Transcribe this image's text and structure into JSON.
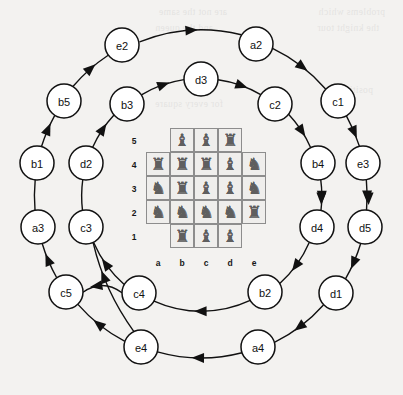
{
  "figure": {
    "type": "state-transition-diagram-with-chessboard"
  },
  "background_bleed_text": [
    "problems which",
    "are not the same",
    "the knight tour",
    "and the queen",
    "positions",
    "for every square"
  ],
  "board": {
    "files": [
      "a",
      "b",
      "c",
      "d",
      "e"
    ],
    "ranks": [
      "5",
      "4",
      "3",
      "2",
      "1"
    ],
    "rank_labels": [
      "5",
      "4",
      "3",
      "2",
      "1"
    ],
    "file_labels": [
      "a",
      "b",
      "c",
      "d",
      "e"
    ],
    "piece_glyphs": {
      "rook": "♜",
      "bishop": "♝",
      "knight": "♞",
      "empty": ""
    },
    "cells": [
      {
        "file": "b",
        "rank": "5",
        "piece": "bishop"
      },
      {
        "file": "c",
        "rank": "5",
        "piece": "bishop"
      },
      {
        "file": "d",
        "rank": "5",
        "piece": "rook"
      },
      {
        "file": "a",
        "rank": "4",
        "piece": "rook"
      },
      {
        "file": "b",
        "rank": "4",
        "piece": "rook"
      },
      {
        "file": "c",
        "rank": "4",
        "piece": "rook"
      },
      {
        "file": "d",
        "rank": "4",
        "piece": "bishop"
      },
      {
        "file": "e",
        "rank": "4",
        "piece": "knight"
      },
      {
        "file": "a",
        "rank": "3",
        "piece": "knight"
      },
      {
        "file": "b",
        "rank": "3",
        "piece": "rook"
      },
      {
        "file": "c",
        "rank": "3",
        "piece": "bishop"
      },
      {
        "file": "d",
        "rank": "3",
        "piece": "bishop"
      },
      {
        "file": "e",
        "rank": "3",
        "piece": "knight"
      },
      {
        "file": "a",
        "rank": "2",
        "piece": "knight"
      },
      {
        "file": "b",
        "rank": "2",
        "piece": "knight"
      },
      {
        "file": "c",
        "rank": "2",
        "piece": "knight"
      },
      {
        "file": "d",
        "rank": "2",
        "piece": "knight"
      },
      {
        "file": "e",
        "rank": "2",
        "piece": "rook"
      },
      {
        "file": "b",
        "rank": "1",
        "piece": "rook"
      },
      {
        "file": "c",
        "rank": "1",
        "piece": "bishop"
      },
      {
        "file": "d",
        "rank": "1",
        "piece": "bishop"
      }
    ]
  },
  "graph": {
    "outer_cycle": {
      "name": "outer-cycle",
      "nodes": [
        "e2",
        "a2",
        "c1",
        "e3",
        "d5",
        "d1",
        "a4",
        "e4",
        "c5",
        "a3",
        "b1",
        "b5"
      ],
      "direction": "clockwise"
    },
    "inner_cycle": {
      "name": "inner-cycle",
      "nodes": [
        "d3",
        "c2",
        "b4",
        "d4",
        "b2",
        "c4",
        "c3",
        "d2",
        "b3"
      ],
      "direction": "clockwise"
    },
    "nodes": [
      {
        "id": "e2",
        "label": "e2",
        "cx": 122,
        "cy": 45,
        "ring": "outer"
      },
      {
        "id": "a2",
        "label": "a2",
        "cx": 256,
        "cy": 44,
        "ring": "outer"
      },
      {
        "id": "c1",
        "label": "c1",
        "cx": 338,
        "cy": 101,
        "ring": "outer"
      },
      {
        "id": "e3",
        "label": "e3",
        "cx": 363,
        "cy": 163,
        "ring": "outer"
      },
      {
        "id": "d5",
        "label": "d5",
        "cx": 365,
        "cy": 227,
        "ring": "outer"
      },
      {
        "id": "d1",
        "label": "d1",
        "cx": 336,
        "cy": 293,
        "ring": "outer"
      },
      {
        "id": "a4",
        "label": "a4",
        "cx": 258,
        "cy": 347,
        "ring": "outer"
      },
      {
        "id": "e4",
        "label": "e4",
        "cx": 141,
        "cy": 347,
        "ring": "outer"
      },
      {
        "id": "c5",
        "label": "c5",
        "cx": 66,
        "cy": 292,
        "ring": "outer"
      },
      {
        "id": "a3",
        "label": "a3",
        "cx": 38,
        "cy": 227,
        "ring": "outer"
      },
      {
        "id": "b1",
        "label": "b1",
        "cx": 37,
        "cy": 163,
        "ring": "outer"
      },
      {
        "id": "b5",
        "label": "b5",
        "cx": 64,
        "cy": 101,
        "ring": "outer"
      },
      {
        "id": "d3",
        "label": "d3",
        "cx": 201,
        "cy": 79,
        "ring": "inner"
      },
      {
        "id": "c2",
        "label": "c2",
        "cx": 275,
        "cy": 104,
        "ring": "inner"
      },
      {
        "id": "b4",
        "label": "b4",
        "cx": 318,
        "cy": 163,
        "ring": "inner"
      },
      {
        "id": "d4",
        "label": "d4",
        "cx": 317,
        "cy": 227,
        "ring": "inner"
      },
      {
        "id": "b2",
        "label": "b2",
        "cx": 265,
        "cy": 292,
        "ring": "inner"
      },
      {
        "id": "c4",
        "label": "c4",
        "cx": 139,
        "cy": 293,
        "ring": "inner"
      },
      {
        "id": "c3",
        "label": "c3",
        "cx": 86,
        "cy": 227,
        "ring": "inner"
      },
      {
        "id": "d2",
        "label": "d2",
        "cx": 86,
        "cy": 163,
        "ring": "inner"
      },
      {
        "id": "b3",
        "label": "b3",
        "cx": 127,
        "cy": 104,
        "ring": "inner"
      }
    ],
    "edges": [
      {
        "from": "e2",
        "to": "a2"
      },
      {
        "from": "a2",
        "to": "c1"
      },
      {
        "from": "c1",
        "to": "e3"
      },
      {
        "from": "e3",
        "to": "d5"
      },
      {
        "from": "d5",
        "to": "d1"
      },
      {
        "from": "d1",
        "to": "a4"
      },
      {
        "from": "a4",
        "to": "e4"
      },
      {
        "from": "e4",
        "to": "c5"
      },
      {
        "from": "c5",
        "to": "a3"
      },
      {
        "from": "a3",
        "to": "b1"
      },
      {
        "from": "b1",
        "to": "b5"
      },
      {
        "from": "b5",
        "to": "e2"
      },
      {
        "from": "b3",
        "to": "d3"
      },
      {
        "from": "d3",
        "to": "c2"
      },
      {
        "from": "c2",
        "to": "b4"
      },
      {
        "from": "b4",
        "to": "d4"
      },
      {
        "from": "d4",
        "to": "b2"
      },
      {
        "from": "b2",
        "to": "c4"
      },
      {
        "from": "c4",
        "to": "c3"
      },
      {
        "from": "c3",
        "to": "d2"
      },
      {
        "from": "d2",
        "to": "b3"
      },
      {
        "from": "c4",
        "to": "c5"
      },
      {
        "from": "e4",
        "to": "c3"
      }
    ]
  }
}
